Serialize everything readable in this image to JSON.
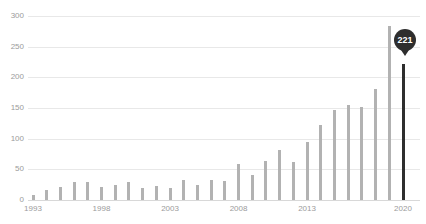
{
  "chart_data": {
    "type": "bar",
    "title": "",
    "xlabel": "",
    "ylabel": "",
    "categories": [
      "1993",
      "1994",
      "1995",
      "1996",
      "1997",
      "1998",
      "1999",
      "2000",
      "2001",
      "2002",
      "2003",
      "2004",
      "2005",
      "2006",
      "2007",
      "2008",
      "2009",
      "2010",
      "2011",
      "2012",
      "2013",
      "2014",
      "2015",
      "2016",
      "2017",
      "2018",
      "2019",
      "2020"
    ],
    "values": [
      8,
      16,
      22,
      29,
      30,
      22,
      24,
      29,
      20,
      23,
      20,
      32,
      25,
      33,
      31,
      58,
      41,
      64,
      81,
      62,
      95,
      123,
      146,
      155,
      152,
      181,
      283,
      221
    ],
    "ylim": [
      0,
      300
    ],
    "y_ticks": [
      0,
      50,
      100,
      150,
      200,
      250,
      300
    ],
    "x_ticks": [
      {
        "index": 0,
        "label": "1993"
      },
      {
        "index": 5,
        "label": "1998"
      },
      {
        "index": 10,
        "label": "2003"
      },
      {
        "index": 15,
        "label": "2008"
      },
      {
        "index": 20,
        "label": "2013"
      },
      {
        "index": 27,
        "label": "2020"
      }
    ],
    "grid": "horizontal",
    "legend": "none",
    "highlight": {
      "category": "2020",
      "value": 221,
      "label": "221"
    },
    "colors": {
      "bar": "#b2b2b2",
      "highlight_bar": "#2e2e2e",
      "badge_bg": "#2e2e2e",
      "badge_text": "#ffffff",
      "gridline": "#e8e8e8",
      "axis_label": "#9b9b9b",
      "background": "#ffffff"
    }
  }
}
